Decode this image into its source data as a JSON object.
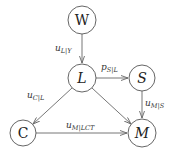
{
  "diagram": {
    "nodes": [
      {
        "id": "W",
        "label": "W",
        "cx": 82,
        "cy": 20,
        "r": 14,
        "italic": false
      },
      {
        "id": "L",
        "label": "L",
        "cx": 82,
        "cy": 78,
        "r": 14,
        "italic": true
      },
      {
        "id": "S",
        "label": "S",
        "cx": 142,
        "cy": 78,
        "r": 13,
        "italic": true
      },
      {
        "id": "C",
        "label": "C",
        "cx": 23,
        "cy": 133,
        "r": 13,
        "italic": false
      },
      {
        "id": "M",
        "label": "M",
        "cx": 142,
        "cy": 133,
        "r": 14,
        "italic": true
      }
    ],
    "edges": [
      {
        "from": "W",
        "to": "L",
        "label_main": "u",
        "label_sub": "L|Y"
      },
      {
        "from": "L",
        "to": "S",
        "label_main": "p",
        "label_sub": "S|L"
      },
      {
        "from": "L",
        "to": "C",
        "label_main": "u",
        "label_sub": "C|L"
      },
      {
        "from": "L",
        "to": "M",
        "label_main": "",
        "label_sub": ""
      },
      {
        "from": "S",
        "to": "M",
        "label_main": "u",
        "label_sub": "M|S"
      },
      {
        "from": "C",
        "to": "M",
        "label_main": "u",
        "label_sub": "M|LCT"
      }
    ]
  }
}
